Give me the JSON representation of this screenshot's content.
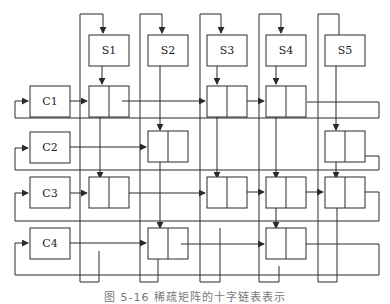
{
  "figure": {
    "type": "orthogonal-linked-list",
    "caption": "图 5-16 稀疏矩阵的十字链表表示",
    "column_heads": [
      {
        "label": "S1",
        "x": 89
      },
      {
        "label": "S2",
        "x": 148
      },
      {
        "label": "S3",
        "x": 207
      },
      {
        "label": "S4",
        "x": 266
      },
      {
        "label": "S5",
        "x": 325
      }
    ],
    "row_heads": [
      {
        "label": "C1",
        "y": 86
      },
      {
        "label": "C2",
        "y": 132
      },
      {
        "label": "C3",
        "y": 187
      },
      {
        "label": "C4",
        "y": 238
      }
    ],
    "nodes": [
      {
        "row": 1,
        "col": 1
      },
      {
        "row": 1,
        "col": 3
      },
      {
        "row": 1,
        "col": 4
      },
      {
        "row": 2,
        "col": 2
      },
      {
        "row": 2,
        "col": 5
      },
      {
        "row": 3,
        "col": 1
      },
      {
        "row": 3,
        "col": 3
      },
      {
        "row": 3,
        "col": 4
      },
      {
        "row": 3,
        "col": 5
      },
      {
        "row": 4,
        "col": 2
      },
      {
        "row": 4,
        "col": 4
      }
    ],
    "colors": {
      "line": "#2a2a2a",
      "background": "#ffffff"
    }
  }
}
